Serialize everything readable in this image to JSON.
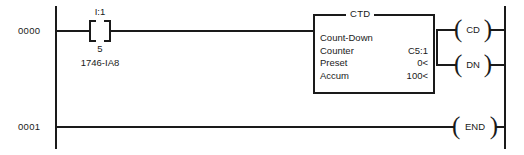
{
  "diagram": {
    "type": "ladder-logic"
  },
  "rungs": [
    {
      "number": "0000",
      "contact": {
        "address": "I:1",
        "bit": "5",
        "module": "1746-IA8",
        "type": "examine-if-closed"
      },
      "instruction": {
        "mnemonic": "CTD",
        "description": "Count-Down",
        "rows": [
          {
            "label": "Count-Down",
            "value": ""
          },
          {
            "label": "Counter",
            "value": "C5:1"
          },
          {
            "label": "Preset",
            "value": "0<"
          },
          {
            "label": "Accum",
            "value": "100<"
          }
        ]
      },
      "coils": [
        {
          "label": "CD"
        },
        {
          "label": "DN"
        }
      ]
    },
    {
      "number": "0001",
      "coils": [
        {
          "label": "END"
        }
      ]
    }
  ],
  "colors": {
    "line": "#1a1a1a",
    "background": "#ffffff"
  }
}
